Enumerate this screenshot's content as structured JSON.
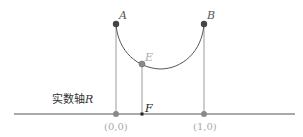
{
  "diagram": {
    "colors": {
      "axis": "#555555",
      "vertical_lines": "#9a9a9a",
      "arc": "#555555",
      "point_dark": "#444444",
      "point_gray": "#8a8a8a",
      "label_dark": "#333333",
      "label_gray": "#aaaaaa"
    },
    "axis_label": "实数轴R",
    "axis_label_main": "实数轴",
    "axis_label_var": "R",
    "points": {
      "A": {
        "label": "A"
      },
      "B": {
        "label": "B"
      },
      "E": {
        "label": "E"
      },
      "F": {
        "label": "F"
      },
      "origin": {
        "label": "(0,0)"
      },
      "one": {
        "label": "(1,0)"
      }
    }
  }
}
